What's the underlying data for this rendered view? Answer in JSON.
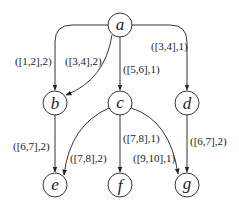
{
  "diagram": {
    "nodes": [
      {
        "id": "a",
        "label": "a",
        "x": 120,
        "y": 25
      },
      {
        "id": "b",
        "label": "b",
        "x": 55,
        "y": 103
      },
      {
        "id": "c",
        "label": "c",
        "x": 120,
        "y": 103
      },
      {
        "id": "d",
        "label": "d",
        "x": 187,
        "y": 103
      },
      {
        "id": "e",
        "label": "e",
        "x": 55,
        "y": 185
      },
      {
        "id": "f",
        "label": "f",
        "x": 120,
        "y": 185
      },
      {
        "id": "g",
        "label": "g",
        "x": 187,
        "y": 185
      }
    ],
    "edges": [
      {
        "from": "a",
        "to": "b",
        "label": "([1,2],2)"
      },
      {
        "from": "a",
        "to": "b",
        "label": "([3,4],2)"
      },
      {
        "from": "a",
        "to": "c",
        "label": "([5,6],1)"
      },
      {
        "from": "a",
        "to": "d",
        "label": "([3,4],1)"
      },
      {
        "from": "b",
        "to": "e",
        "label": "([6,7],2)"
      },
      {
        "from": "c",
        "to": "e",
        "label": "([7,8],2)"
      },
      {
        "from": "c",
        "to": "f",
        "label": "([7,8],1)"
      },
      {
        "from": "c",
        "to": "g",
        "label": "([9,10],1)"
      },
      {
        "from": "d",
        "to": "g",
        "label": "([6,7],2)"
      }
    ]
  }
}
